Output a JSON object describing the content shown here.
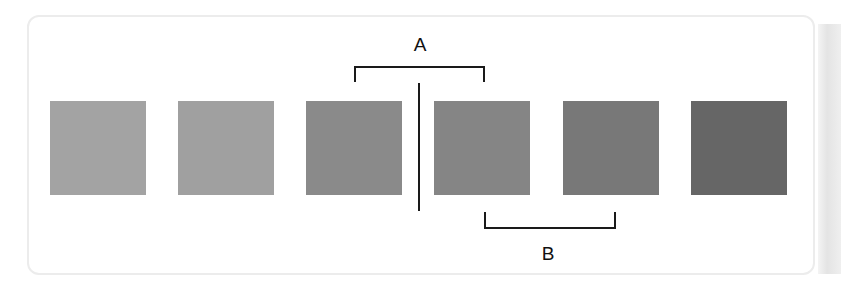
{
  "diagram": {
    "swatches": [
      {
        "index": 1,
        "color": "#a3a3a3"
      },
      {
        "index": 2,
        "color": "#a0a0a0"
      },
      {
        "index": 3,
        "color": "#8a8a8a"
      },
      {
        "index": 4,
        "color": "#858585"
      },
      {
        "index": 5,
        "color": "#787878"
      },
      {
        "index": 6,
        "color": "#666666"
      }
    ],
    "annotations": {
      "a": {
        "label": "A",
        "spans": [
          3,
          4
        ],
        "position": "top"
      },
      "b": {
        "label": "B",
        "spans": [
          4,
          5
        ],
        "position": "bottom"
      }
    },
    "divider": {
      "between": [
        3,
        4
      ]
    }
  }
}
